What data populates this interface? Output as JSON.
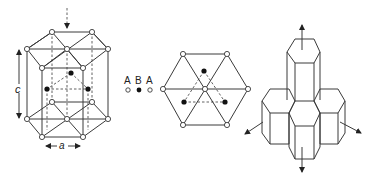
{
  "figure": {
    "panels": [
      {
        "id": "unit-cell",
        "description": "Hexagonal close-packed unit cell",
        "labels": {
          "height": "c",
          "width": "a"
        }
      },
      {
        "id": "stacking",
        "description": "ABA stacking viewed along c-axis",
        "legend": {
          "sequence": [
            "A",
            "B",
            "A"
          ],
          "markers": [
            "open",
            "filled",
            "open"
          ]
        }
      },
      {
        "id": "crystal-habit",
        "description": "Hexagonal prism crystal growth with directional arrows"
      }
    ],
    "colors": {
      "line": "#3a3a3a",
      "atom_open": "#ffffff",
      "atom_filled": "#111111",
      "background": "#ffffff"
    }
  }
}
